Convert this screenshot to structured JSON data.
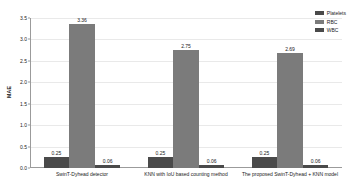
{
  "chart_data": {
    "type": "bar",
    "title": "",
    "xlabel": "",
    "ylabel": "MAE",
    "ylim": [
      0.0,
      3.5
    ],
    "yticks": [
      "0.0",
      "0.5",
      "1.0",
      "1.5",
      "2.0",
      "2.5",
      "3.0",
      "3.5"
    ],
    "ytick_values": [
      0.0,
      0.5,
      1.0,
      1.5,
      2.0,
      2.5,
      3.0,
      3.5
    ],
    "grid": true,
    "legend_position": "top-right",
    "categories": [
      "SwinT-Dyhead detector",
      "KNN with IoU based counting method",
      "The proposed SwinT-Dyhead + KNN model"
    ],
    "series": [
      {
        "name": "Platelets",
        "color": "#4a4a4a",
        "values": [
          0.25,
          0.25,
          0.25
        ],
        "labels": [
          "0.25",
          "0.25",
          "0.25"
        ]
      },
      {
        "name": "RBC",
        "color": "#7b7b7b",
        "values": [
          3.36,
          2.75,
          2.69
        ],
        "labels": [
          "3.36",
          "2.75",
          "2.69"
        ]
      },
      {
        "name": "WBC",
        "color": "#4a4a4a",
        "values": [
          0.06,
          0.06,
          0.06
        ],
        "labels": [
          "0.06",
          "0.06",
          "0.06"
        ]
      }
    ]
  },
  "colors": {
    "background": "#ffffff",
    "axis": "#9b9b9b",
    "gridline": "#e9e9e9",
    "text": "#1a1a1a"
  }
}
